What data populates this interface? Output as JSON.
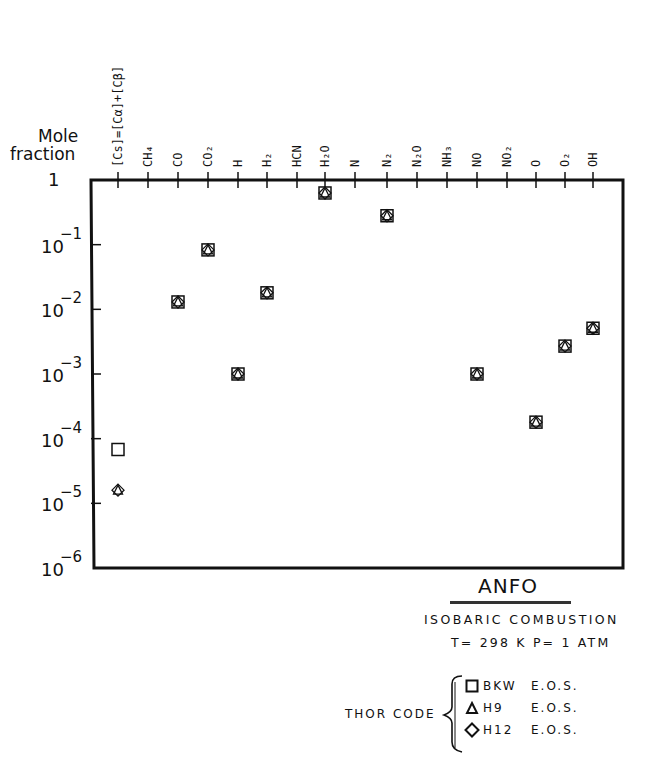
{
  "chart_data": {
    "type": "scatter",
    "title": "ANFO",
    "subtitle": [
      "ISOBARIC COMBUSTION",
      "T= 298 K  P= 1 ATM"
    ],
    "ylabel": "Mole fraction",
    "xlabel": "",
    "yscale": "log",
    "ylim": [
      1e-06,
      1
    ],
    "yticks": [
      "1",
      "10-1",
      "10-2",
      "10-3",
      "10-4",
      "10-5",
      "10-6"
    ],
    "categories": [
      "[Cs]=[Cα]+[Cβ]",
      "CH4",
      "CO",
      "CO2",
      "H",
      "H2",
      "HCN",
      "H2O",
      "N",
      "N2",
      "N2O",
      "NH3",
      "NO",
      "NO2",
      "O",
      "O2",
      "OH"
    ],
    "series": [
      {
        "name": "BKW E.O.S.",
        "marker": "square",
        "values": [
          6.8e-05,
          null,
          0.013,
          0.083,
          0.001,
          0.018,
          null,
          0.63,
          null,
          0.28,
          null,
          null,
          0.001,
          null,
          0.00018,
          0.0027,
          0.0051
        ]
      },
      {
        "name": "H9 E.O.S.",
        "marker": "triangle",
        "values": [
          1.6e-05,
          null,
          0.013,
          0.083,
          0.001,
          0.018,
          null,
          0.63,
          null,
          0.28,
          null,
          null,
          0.001,
          null,
          0.00018,
          0.0027,
          0.0051
        ]
      },
      {
        "name": "H12 E.O.S.",
        "marker": "diamond",
        "values": [
          1.6e-05,
          null,
          0.013,
          0.083,
          0.001,
          0.018,
          null,
          0.63,
          null,
          0.28,
          null,
          null,
          0.001,
          null,
          0.00018,
          0.0027,
          0.0051
        ]
      }
    ],
    "legend": {
      "group_label": "THOR CODE",
      "position": "bottom-right"
    },
    "grid": false
  },
  "captions": {
    "title": "ANFO",
    "line1": "ISOBARIC COMBUSTION",
    "line2": "T= 298 K  P= 1 ATM"
  },
  "legend": {
    "group_label": "THOR CODE",
    "items": [
      {
        "symbol": "square-icon",
        "code": "BKW",
        "eos": "E.O.S."
      },
      {
        "symbol": "triangle-icon",
        "code": "H9",
        "eos": "E.O.S."
      },
      {
        "symbol": "diamond-icon",
        "code": "H12",
        "eos": "E.O.S."
      }
    ]
  }
}
